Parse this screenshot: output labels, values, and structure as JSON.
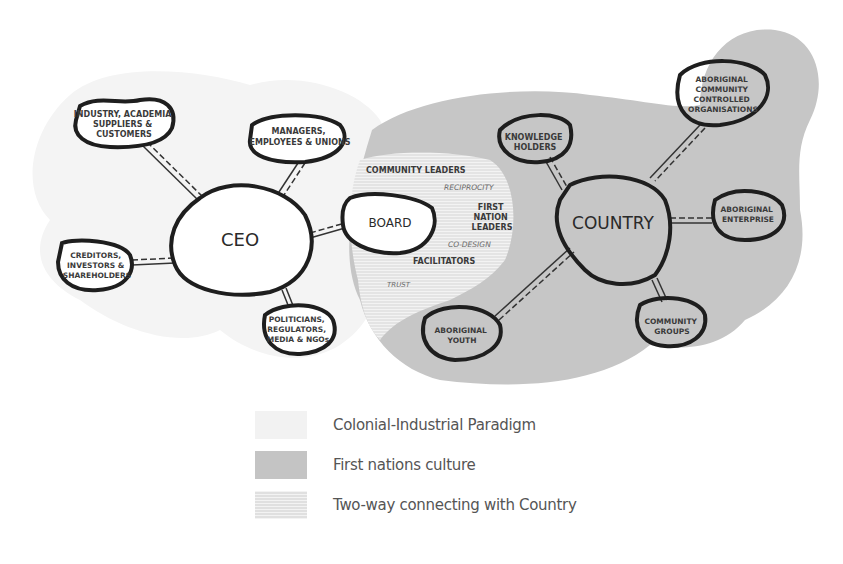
{
  "diagram": {
    "left_network": {
      "center": "CEO",
      "nodes": [
        {
          "lines": [
            "INDUSTRY, ACADEMIA",
            "SUPPLIERS &",
            "CUSTOMERS"
          ]
        },
        {
          "lines": [
            "MANAGERS,",
            "EMPLOYEES & UNIONS"
          ]
        },
        {
          "lines": [
            "CREDITORS,",
            "INVESTORS &",
            "SHAREHOLDERS"
          ]
        },
        {
          "lines": [
            "POLITICIANS,",
            "REGULATORS,",
            "MEDIA & NGOs"
          ]
        },
        {
          "lines": [
            "BOARD"
          ]
        }
      ]
    },
    "right_network": {
      "center": "COUNTRY",
      "nodes": [
        {
          "lines": [
            "KNOWLEDGE",
            "HOLDERS"
          ]
        },
        {
          "lines": [
            "ABORIGINAL",
            "COMMUNITY",
            "CONTROLLED",
            "ORGANISATIONS"
          ]
        },
        {
          "lines": [
            "ABORIGINAL",
            "ENTERPRISE"
          ]
        },
        {
          "lines": [
            "COMMUNITY",
            "GROUPS"
          ]
        },
        {
          "lines": [
            "ABORIGINAL",
            "YOUTH"
          ]
        }
      ]
    },
    "bridge": {
      "community_leaders": "COMMUNITY LEADERS",
      "reciprocity": "RECIPROCITY",
      "first_nation_leaders": [
        "FIRST",
        "NATION",
        "LEADERS"
      ],
      "co_design": "CO-DESIGN",
      "facilitators": "FACILITATORS",
      "trust": "TRUST"
    }
  },
  "legend": [
    {
      "label": "Colonial-Industrial Paradigm",
      "color": "#f2f2f2"
    },
    {
      "label": "First nations culture",
      "color": "#c4c4c4"
    },
    {
      "label": "Two-way connecting with Country",
      "color": "#e2e2e2"
    }
  ]
}
